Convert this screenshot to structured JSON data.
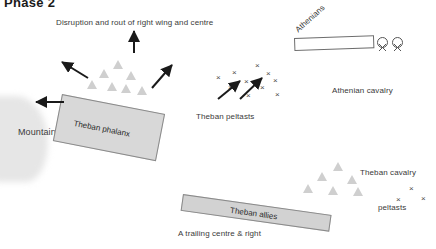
{
  "title": "Phase 2",
  "annotations": {
    "top_caption": "Disruption and rout of right wing and centre",
    "bottom_caption": "A trailing centre & right"
  },
  "units": [
    {
      "id": "theban-phalanx",
      "label": "Theban phalanx",
      "side": "Theban",
      "type": "hoplite-block"
    },
    {
      "id": "theban-allies",
      "label": "Theban allies",
      "side": "Theban",
      "type": "hoplite-block"
    },
    {
      "id": "athenians",
      "label": "Athenians",
      "side": "Athenian",
      "type": "hoplite-block"
    },
    {
      "id": "athenian-cavalry",
      "label": "Athenian cavalry",
      "side": "Athenian",
      "type": "cavalry"
    },
    {
      "id": "theban-cavalry",
      "label": "Theban cavalry",
      "side": "Theban",
      "type": "cavalry"
    },
    {
      "id": "theban-peltasts",
      "label": "Theban peltasts",
      "side": "Theban",
      "type": "peltasts"
    },
    {
      "id": "peltasts",
      "label": "peltasts",
      "side": "Theban",
      "type": "peltasts"
    }
  ],
  "terrain": {
    "label": "Mountain",
    "type": "high-ground"
  },
  "colors": {
    "phalanx_fill": "#d8d8d8",
    "allies_fill": "#d2d2d2",
    "athenians_fill": "#ffffff",
    "mountain_fill": "#e6e6e6",
    "arrow": "#1a1a1a",
    "outline": "#8a8a8a",
    "text": "#3a3a3a"
  },
  "icons": {
    "arrow": "arrow-icon",
    "triangle_up": "triangle-up-icon",
    "triangle_down": "triangle-down-icon",
    "x_mark": "x-mark-icon",
    "circled_x": "circled-x-icon"
  },
  "markers": {
    "triangles_up_phalanx": [
      {
        "x": 118,
        "y": 64
      },
      {
        "x": 104,
        "y": 73
      },
      {
        "x": 131,
        "y": 75
      },
      {
        "x": 92,
        "y": 84
      },
      {
        "x": 112,
        "y": 86
      },
      {
        "x": 126,
        "y": 88
      },
      {
        "x": 142,
        "y": 90
      }
    ],
    "triangles_up_cavalry": [
      {
        "x": 338,
        "y": 166
      },
      {
        "x": 322,
        "y": 176
      },
      {
        "x": 352,
        "y": 179
      },
      {
        "x": 308,
        "y": 188
      },
      {
        "x": 333,
        "y": 190
      },
      {
        "x": 358,
        "y": 191
      }
    ],
    "triangles_down_athenian": [
      {
        "x": 344,
        "y": 60
      },
      {
        "x": 360,
        "y": 60
      },
      {
        "x": 340,
        "y": 73
      },
      {
        "x": 357,
        "y": 73
      }
    ],
    "x_theban_peltasts": [
      {
        "x": 258,
        "y": 66
      },
      {
        "x": 235,
        "y": 73
      },
      {
        "x": 269,
        "y": 74
      },
      {
        "x": 219,
        "y": 78
      },
      {
        "x": 247,
        "y": 82
      },
      {
        "x": 276,
        "y": 81
      },
      {
        "x": 231,
        "y": 88
      },
      {
        "x": 263,
        "y": 88
      },
      {
        "x": 249,
        "y": 96
      },
      {
        "x": 278,
        "y": 95
      }
    ],
    "x_right_peltasts": [
      {
        "x": 412,
        "y": 189
      },
      {
        "x": 399,
        "y": 200
      },
      {
        "x": 424,
        "y": 199
      }
    ],
    "circled_x_athenian": [
      {
        "x": 382,
        "y": 42
      },
      {
        "x": 397,
        "y": 42
      }
    ]
  },
  "arrows": [
    {
      "id": "rout-up",
      "x1": 134,
      "y1": 53,
      "x2": 134,
      "y2": 31
    },
    {
      "id": "rout-up-left",
      "x1": 88,
      "y1": 78,
      "x2": 62,
      "y2": 62
    },
    {
      "id": "rout-up-right",
      "x1": 152,
      "y1": 88,
      "x2": 172,
      "y2": 65
    },
    {
      "id": "rout-left",
      "x1": 64,
      "y1": 102,
      "x2": 36,
      "y2": 102
    },
    {
      "id": "peltast-advance-1",
      "x1": 218,
      "y1": 99,
      "x2": 240,
      "y2": 81
    },
    {
      "id": "peltast-advance-2",
      "x1": 240,
      "y1": 99,
      "x2": 262,
      "y2": 78
    }
  ]
}
